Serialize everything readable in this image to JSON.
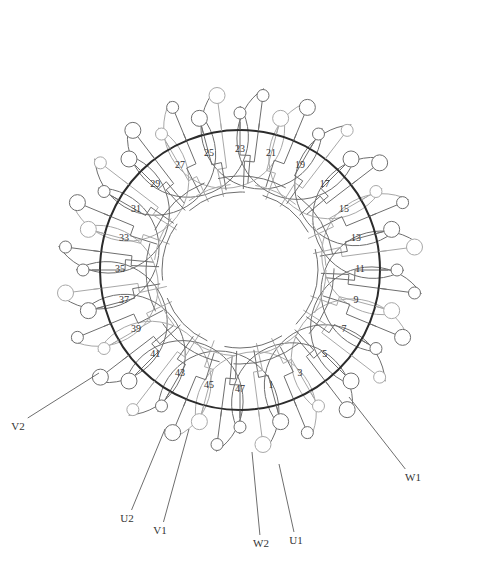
{
  "diagram": {
    "type": "stator-winding-diagram",
    "center": [
      240,
      270
    ],
    "ring_radius": 140,
    "slot_count": 48,
    "slot_labels": [
      "1",
      "3",
      "5",
      "7",
      "9",
      "11",
      "13",
      "15",
      "17",
      "19",
      "21",
      "23",
      "25",
      "27",
      "29",
      "31",
      "33",
      "35",
      "37",
      "39",
      "41",
      "43",
      "45",
      "47"
    ],
    "leads": [
      {
        "id": "U1",
        "label": "U1",
        "label_pos": [
          296,
          541
        ],
        "from": [
          279,
          464
        ]
      },
      {
        "id": "U2",
        "label": "U2",
        "label_pos": [
          127,
          519
        ],
        "from": [
          165,
          429
        ]
      },
      {
        "id": "V1",
        "label": "V1",
        "label_pos": [
          160,
          531
        ],
        "from": [
          189,
          429
        ]
      },
      {
        "id": "V2",
        "label": "V2",
        "label_pos": [
          18,
          427
        ],
        "from": [
          99,
          373
        ]
      },
      {
        "id": "W1",
        "label": "W1",
        "label_pos": [
          413,
          478
        ],
        "from": [
          349,
          397
        ]
      },
      {
        "id": "W2",
        "label": "W2",
        "label_pos": [
          261,
          544
        ],
        "from": [
          252,
          452
        ]
      }
    ],
    "colors": {
      "ring": "#2b2b2b",
      "coil_dark": "#6e6e6e",
      "coil_light": "#a8a8a8",
      "background": "#ffffff"
    }
  }
}
